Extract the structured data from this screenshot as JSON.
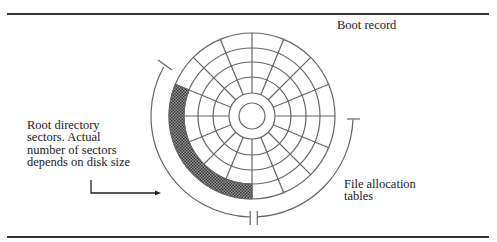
{
  "figure": {
    "labels": {
      "boot_record": "Boot record",
      "file_allocation_tables": [
        "File allocation",
        "tables"
      ],
      "root_directory": [
        "Root directory",
        "sectors. Actual",
        "number of sectors",
        "depends on disk size"
      ]
    },
    "disk": {
      "center": [
        252,
        116
      ],
      "hub_radius": 13,
      "ring_radii": [
        23,
        39,
        54,
        68,
        83
      ],
      "spoke_count": 16,
      "shaded_ring": {
        "inner": 68,
        "outer": 83,
        "start_deg": 157.5,
        "end_deg": 270
      },
      "shade_color": "#555555"
    },
    "brackets": {
      "radius": 101,
      "root_directory_arc": {
        "start_deg": 151,
        "end_deg": 269
      },
      "file_allocation_arc": {
        "start_deg": 273,
        "end_deg": 358
      }
    },
    "colors": {
      "line": "#555555",
      "rule": "#333333",
      "text": "#222222"
    }
  }
}
